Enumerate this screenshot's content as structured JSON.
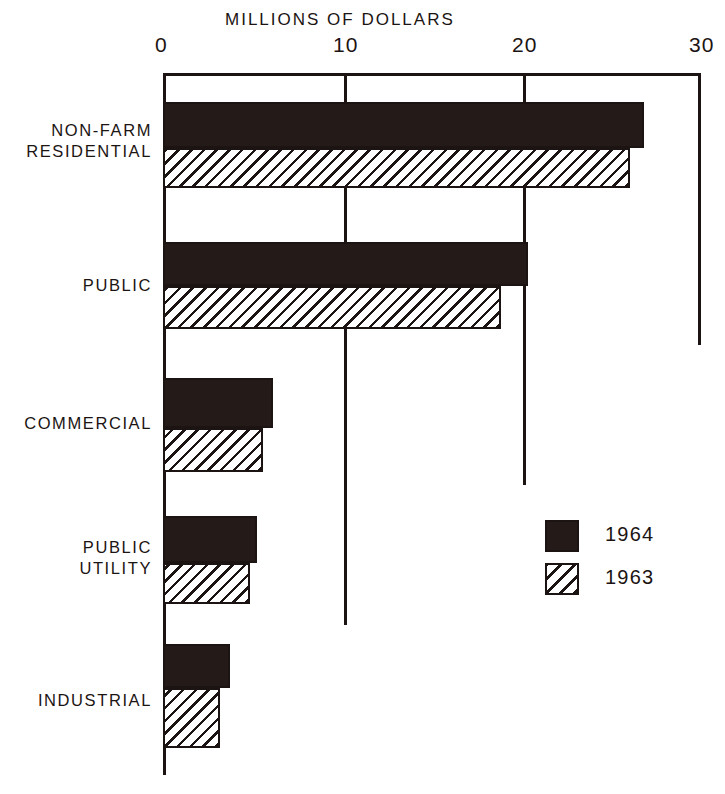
{
  "chart_data": {
    "type": "bar",
    "orientation": "horizontal",
    "title": "MILLIONS OF DOLLARS",
    "xlabel": "",
    "ylabel": "",
    "xlim": [
      0,
      30
    ],
    "grid": true,
    "legend_position": "middle-right",
    "xticks": [
      "0",
      "10",
      "20",
      "30"
    ],
    "xtick_values": [
      0,
      10,
      20,
      30
    ],
    "categories": [
      "NON-FARM\nRESIDENTIAL",
      "PUBLIC",
      "COMMERCIAL",
      "PUBLIC\nUTILITY",
      "INDUSTRIAL"
    ],
    "series": [
      {
        "name": "1964",
        "style": "solid",
        "values": [
          26.7,
          20.2,
          6.0,
          5.1,
          3.6
        ]
      },
      {
        "name": "1963",
        "style": "hatched",
        "values": [
          25.9,
          18.7,
          5.4,
          4.7,
          3.0
        ]
      }
    ]
  },
  "legend": {
    "items": [
      {
        "label": "1964",
        "style": "solid"
      },
      {
        "label": "1963",
        "style": "hatched"
      }
    ]
  },
  "colors": {
    "ink": "#1b1412",
    "bar_solid": "#241a17",
    "background": "#ffffff"
  }
}
